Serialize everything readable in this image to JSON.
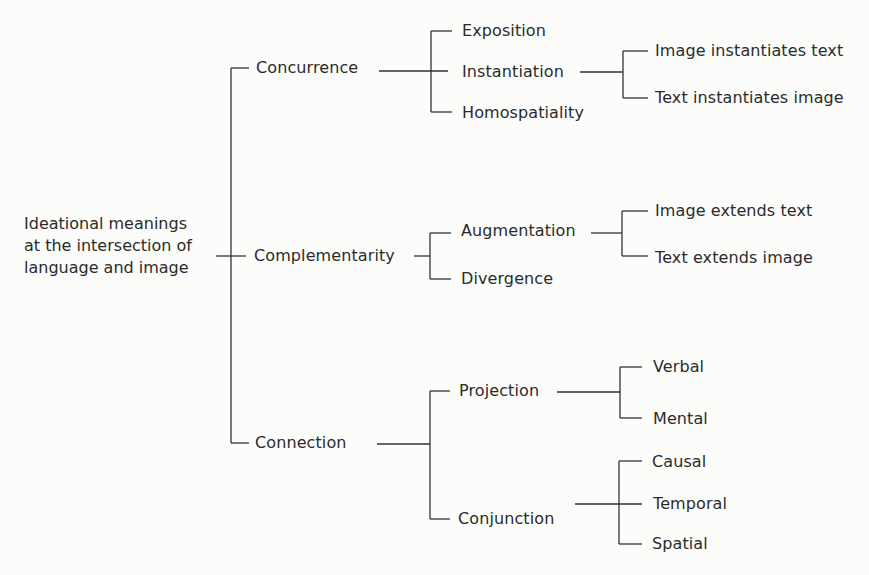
{
  "diagram": {
    "type": "system-network",
    "root": {
      "line1": "Ideational meanings",
      "line2": "at the intersection of",
      "line3": "language and image"
    },
    "level1": {
      "concurrence": "Concurrence",
      "complementarity": "Complementarity",
      "connection": "Connection"
    },
    "concurrence_children": {
      "exposition": "Exposition",
      "instantiation": "Instantiation",
      "homospatiality": "Homospatiality"
    },
    "instantiation_children": {
      "image_instantiates_text": "Image instantiates text",
      "text_instantiates_image": "Text instantiates image"
    },
    "complementarity_children": {
      "augmentation": "Augmentation",
      "divergence": "Divergence"
    },
    "augmentation_children": {
      "image_extends_text": "Image extends text",
      "text_extends_image": "Text extends image"
    },
    "connection_children": {
      "projection": "Projection",
      "conjunction": "Conjunction"
    },
    "projection_children": {
      "verbal": "Verbal",
      "mental": "Mental"
    },
    "conjunction_children": {
      "causal": "Causal",
      "temporal": "Temporal",
      "spatial": "Spatial"
    },
    "line_color": "#333333",
    "text_color": "#2b2b2b"
  }
}
